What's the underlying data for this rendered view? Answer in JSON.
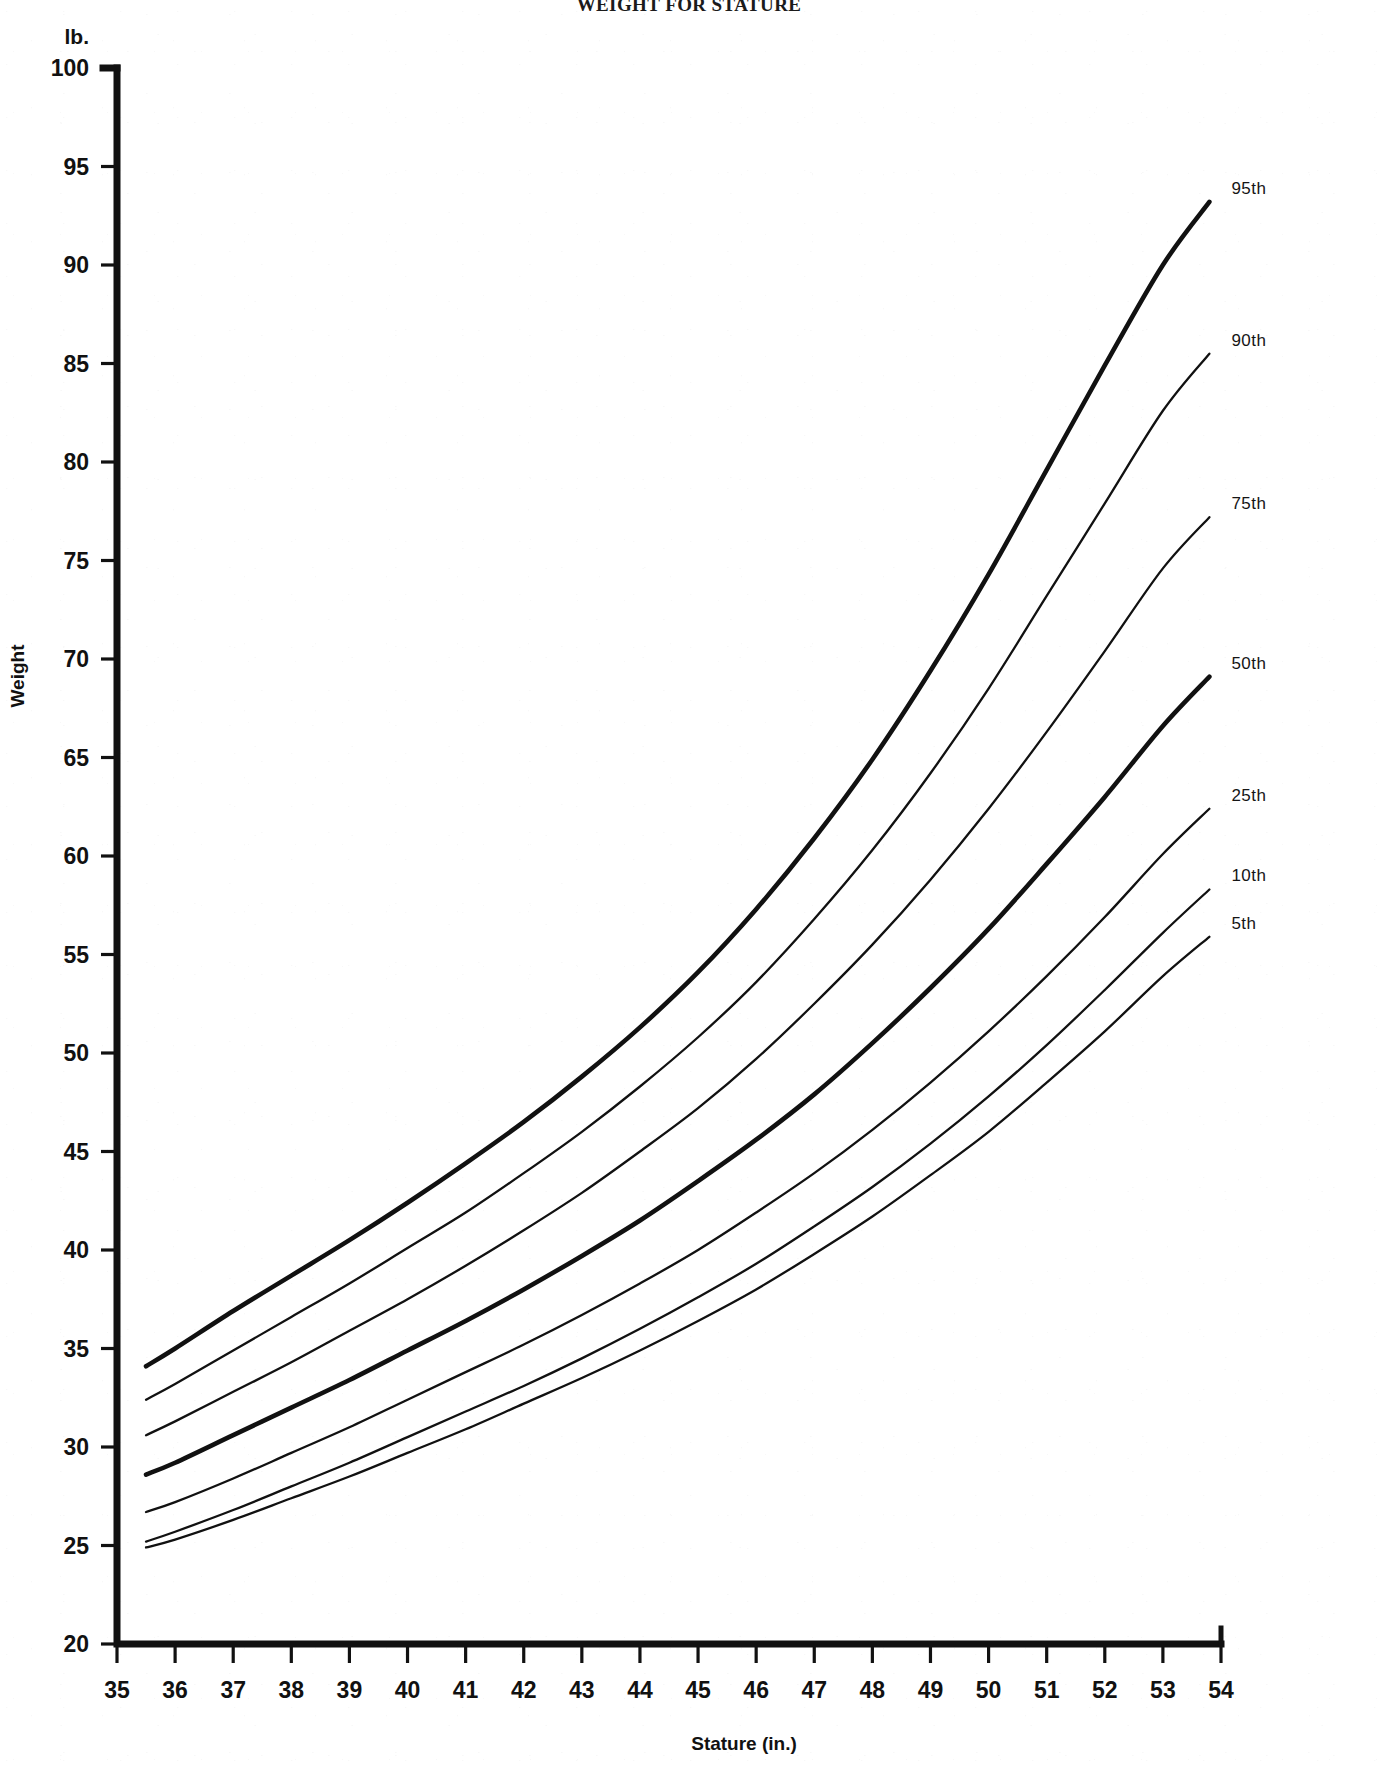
{
  "title": "WEIGHT FOR STATURE",
  "axes": {
    "y_unit": "lb.",
    "y_title": "Weight",
    "x_title": "Stature (in.)",
    "y_ticks": [
      20,
      25,
      30,
      35,
      40,
      45,
      50,
      55,
      60,
      65,
      70,
      75,
      80,
      85,
      90,
      95,
      100
    ],
    "x_ticks": [
      35,
      36,
      37,
      38,
      39,
      40,
      41,
      42,
      43,
      44,
      45,
      46,
      47,
      48,
      49,
      50,
      51,
      52,
      53,
      54
    ]
  },
  "chart_data": {
    "type": "line",
    "title": "WEIGHT FOR STATURE",
    "xlabel": "Stature (in.)",
    "ylabel": "Weight",
    "y_unit": "lb.",
    "x_unit": "in.",
    "xlim": [
      35,
      54
    ],
    "ylim": [
      20,
      100
    ],
    "grid": false,
    "legend": "right-end-of-curve",
    "x": [
      35.5,
      36,
      37,
      38,
      39,
      40,
      41,
      42,
      43,
      44,
      45,
      46,
      47,
      48,
      49,
      50,
      51,
      52,
      53,
      53.8
    ],
    "series": [
      {
        "name": "95th",
        "label": "95th",
        "emphasis": "thick",
        "values": [
          34.1,
          35.0,
          36.9,
          38.7,
          40.5,
          42.4,
          44.4,
          46.5,
          48.8,
          51.3,
          54.1,
          57.3,
          60.9,
          64.9,
          69.4,
          74.3,
          79.6,
          84.9,
          90.0,
          93.2
        ]
      },
      {
        "name": "90th",
        "label": "90th",
        "emphasis": "thin",
        "values": [
          32.4,
          33.2,
          34.9,
          36.6,
          38.3,
          40.1,
          41.9,
          43.9,
          46.0,
          48.3,
          50.8,
          53.6,
          56.8,
          60.3,
          64.2,
          68.5,
          73.2,
          77.9,
          82.6,
          85.5
        ]
      },
      {
        "name": "75th",
        "label": "75th",
        "emphasis": "thin",
        "values": [
          30.6,
          31.3,
          32.8,
          34.3,
          35.9,
          37.5,
          39.2,
          41.0,
          42.9,
          45.0,
          47.2,
          49.7,
          52.5,
          55.5,
          58.8,
          62.4,
          66.3,
          70.4,
          74.6,
          77.2
        ]
      },
      {
        "name": "50th",
        "label": "50th",
        "emphasis": "thick",
        "values": [
          28.6,
          29.2,
          30.6,
          32.0,
          33.4,
          34.9,
          36.4,
          38.0,
          39.7,
          41.5,
          43.5,
          45.6,
          47.9,
          50.5,
          53.3,
          56.3,
          59.6,
          63.0,
          66.6,
          69.1
        ]
      },
      {
        "name": "25th",
        "label": "25th",
        "emphasis": "thin",
        "values": [
          26.7,
          27.2,
          28.4,
          29.7,
          31.0,
          32.4,
          33.8,
          35.2,
          36.7,
          38.3,
          40.0,
          41.9,
          43.9,
          46.1,
          48.5,
          51.1,
          53.9,
          56.9,
          60.1,
          62.4
        ]
      },
      {
        "name": "10th",
        "label": "10th",
        "emphasis": "thin",
        "values": [
          25.2,
          25.7,
          26.8,
          28.0,
          29.2,
          30.5,
          31.8,
          33.1,
          34.5,
          36.0,
          37.6,
          39.3,
          41.2,
          43.2,
          45.4,
          47.8,
          50.4,
          53.2,
          56.1,
          58.3
        ]
      },
      {
        "name": "5th",
        "label": "5th",
        "emphasis": "thin",
        "values": [
          24.9,
          25.3,
          26.3,
          27.4,
          28.5,
          29.7,
          30.9,
          32.2,
          33.5,
          34.9,
          36.4,
          38.0,
          39.8,
          41.7,
          43.8,
          46.0,
          48.5,
          51.1,
          53.9,
          55.9
        ]
      }
    ]
  }
}
